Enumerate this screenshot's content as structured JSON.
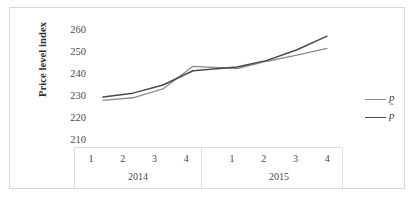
{
  "chart_data": {
    "type": "line",
    "title": "",
    "xlabel": "",
    "ylabel": "Price level index",
    "ylim": [
      210,
      260
    ],
    "yticks": [
      260,
      250,
      240,
      230,
      220,
      210
    ],
    "grid": false,
    "legend_position": "right",
    "x": [
      "1",
      "2",
      "3",
      "4",
      "1",
      "2",
      "3",
      "4"
    ],
    "x_groups": [
      {
        "label": "2014",
        "quarters": [
          "1",
          "2",
          "3",
          "4"
        ]
      },
      {
        "label": "2015",
        "quarters": [
          "1",
          "2",
          "3",
          "4"
        ]
      }
    ],
    "series": [
      {
        "name": "p",
        "color": "#8c8c8c",
        "values": [
          228.0,
          229.2,
          233.2,
          243.5,
          242.5,
          245.8,
          248.6,
          251.6
        ]
      },
      {
        "name": "p̂",
        "color": "#4a4a4a",
        "values": [
          229.5,
          231.3,
          235.0,
          241.5,
          243.2,
          246.2,
          251.0,
          257.2
        ]
      }
    ]
  },
  "legend": {
    "items": [
      {
        "label": "p",
        "hat": false,
        "color": "#8c8c8c"
      },
      {
        "label": "p",
        "hat": true,
        "color": "#4a4a4a"
      }
    ]
  },
  "axes": {
    "y_title": "Price level index"
  }
}
